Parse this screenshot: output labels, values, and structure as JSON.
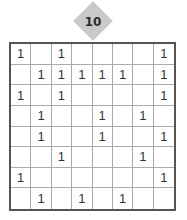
{
  "puzzle": {
    "number": "10",
    "rows": 8,
    "cols": 8,
    "grid": [
      [
        "1",
        "",
        "1",
        "",
        "",
        "",
        "",
        "1"
      ],
      [
        "",
        "1",
        "1",
        "1",
        "1",
        "1",
        "",
        "1"
      ],
      [
        "1",
        "",
        "1",
        "",
        "",
        "",
        "",
        "1"
      ],
      [
        "",
        "1",
        "",
        "",
        "1",
        "",
        "1",
        ""
      ],
      [
        "",
        "1",
        "",
        "",
        "1",
        "",
        "",
        "1"
      ],
      [
        "",
        "",
        "1",
        "",
        "",
        "",
        "1",
        ""
      ],
      [
        "1",
        "",
        "",
        "",
        "",
        "",
        "",
        "1"
      ],
      [
        "",
        "1",
        "",
        "1",
        "",
        "1",
        "",
        ""
      ]
    ]
  },
  "colors": {
    "badge": "#c9c9c9",
    "border": "#555555",
    "gridline": "#aaaaaa"
  }
}
